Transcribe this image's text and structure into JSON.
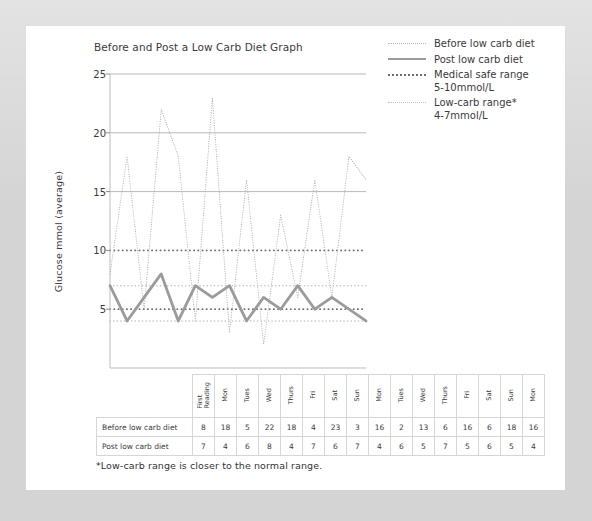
{
  "chart_title": "Before and Post a Low Carb Diet Graph",
  "y_axis_title": "Glucose mmol (average)",
  "footnote": "*Low-carb range is closer to the normal range.",
  "legend": {
    "items": [
      {
        "id": "before-low-carb-diet",
        "label": "Before low carb diet",
        "style": "fine-dotted",
        "color": "#b4b4b4"
      },
      {
        "id": "post-low-carb-diet",
        "label": "Post low carb diet",
        "style": "solid-thick",
        "color": "#9b9b9b"
      },
      {
        "id": "medical-safe-range",
        "label": "Medical safe range\n5-10mmol/L",
        "style": "dotted",
        "color": "#6f6f6f"
      },
      {
        "id": "low-carb-range",
        "label": "Low-carb range*\n4-7mmol/L",
        "style": "dotted-light",
        "color": "#c2c2c2"
      }
    ]
  },
  "table": {
    "row_labels": [
      "Before low carb diet",
      "Post low carb diet"
    ],
    "columns": [
      "First\nReading",
      "Mon",
      "Tues",
      "Wed",
      "Thurs",
      "Fri",
      "Sat",
      "Sun",
      "Mon",
      "Tues",
      "Wed",
      "Thurs",
      "Fri",
      "Sat",
      "Sun",
      "Mon"
    ],
    "rows": [
      [
        8,
        18,
        5,
        22,
        18,
        4,
        23,
        3,
        16,
        2,
        13,
        6,
        16,
        6,
        18,
        16
      ],
      [
        7,
        4,
        6,
        8,
        4,
        7,
        6,
        7,
        4,
        6,
        5,
        7,
        5,
        6,
        5,
        4
      ]
    ]
  },
  "chart_data": {
    "type": "line",
    "title": "Before and Post a Low Carb Diet Graph",
    "xlabel": "",
    "ylabel": "Glucose mmol (average)",
    "ylim": [
      0,
      25
    ],
    "yticks": [
      5,
      10,
      15,
      20,
      25
    ],
    "grid": true,
    "legend_position": "top-right",
    "categories": [
      "First Reading",
      "Mon",
      "Tues",
      "Wed",
      "Thurs",
      "Fri",
      "Sat",
      "Sun",
      "Mon",
      "Tues",
      "Wed",
      "Thurs",
      "Fri",
      "Sat",
      "Sun",
      "Mon"
    ],
    "series": [
      {
        "name": "Before low carb diet",
        "style": "fine-dotted",
        "color": "#b4b4b4",
        "values": [
          8,
          18,
          5,
          22,
          18,
          4,
          23,
          3,
          16,
          2,
          13,
          6,
          16,
          6,
          18,
          16
        ]
      },
      {
        "name": "Post low carb diet",
        "style": "solid-thick",
        "color": "#9b9b9b",
        "values": [
          7,
          4,
          6,
          8,
          4,
          7,
          6,
          7,
          4,
          6,
          5,
          7,
          5,
          6,
          5,
          4
        ]
      }
    ],
    "bands": [
      {
        "name": "Medical safe range",
        "range_label": "5-10mmol/L",
        "low": 5,
        "high": 10,
        "style": "dotted",
        "color": "#6f6f6f"
      },
      {
        "name": "Low-carb range*",
        "range_label": "4-7mmol/L",
        "low": 4,
        "high": 7,
        "style": "dotted-light",
        "color": "#c2c2c2"
      }
    ]
  }
}
